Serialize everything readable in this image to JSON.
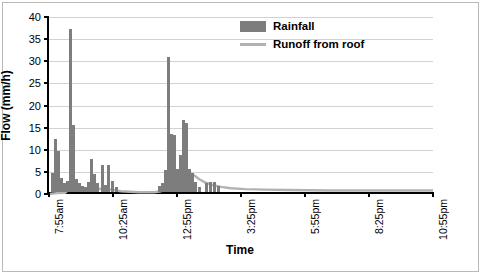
{
  "chart_data": {
    "type": "bar",
    "title": "",
    "xlabel": "Time",
    "ylabel": "Flow (mm/h)",
    "ylim": [
      0,
      40
    ],
    "yticks": [
      0,
      5,
      10,
      15,
      20,
      25,
      30,
      35,
      40
    ],
    "ytick_labels": [
      "0",
      "5",
      "10",
      "15",
      "20",
      "25",
      "30",
      "35",
      "40"
    ],
    "grid": true,
    "legend_position": "top-center",
    "legend": [
      "Rainfall",
      "Runoff from roof"
    ],
    "colors": {
      "rainfall": "#7d7d7d",
      "runoff": "#b2b2b2",
      "axis": "#000000",
      "gridline": "#d2d2d2",
      "frame": "#b9b9b9"
    },
    "xtick_labels": [
      "7:55am",
      "10:25am",
      "12:55pm",
      "3:25pm",
      "5:55pm",
      "8:25pm",
      "10:55pm"
    ],
    "xtick_positions": [
      0,
      64,
      128,
      192,
      256,
      320,
      384
    ],
    "x_axis_range_minutes": [
      475,
      1375
    ],
    "series": [
      {
        "name": "Rainfall",
        "type": "bar",
        "values": [
          {
            "x": 2,
            "y": 4.2
          },
          {
            "x": 5,
            "y": 11.9
          },
          {
            "x": 8,
            "y": 9.3
          },
          {
            "x": 11,
            "y": 3.1
          },
          {
            "x": 14,
            "y": 2.0
          },
          {
            "x": 17,
            "y": 2.6
          },
          {
            "x": 20,
            "y": 36.9
          },
          {
            "x": 23,
            "y": 15.1
          },
          {
            "x": 26,
            "y": 3.0
          },
          {
            "x": 29,
            "y": 2.0
          },
          {
            "x": 32,
            "y": 1.4
          },
          {
            "x": 35,
            "y": 1.2
          },
          {
            "x": 38,
            "y": 2.2
          },
          {
            "x": 41,
            "y": 7.4
          },
          {
            "x": 44,
            "y": 4.0
          },
          {
            "x": 47,
            "y": 2.1
          },
          {
            "x": 52,
            "y": 6.2
          },
          {
            "x": 55,
            "y": 1.6
          },
          {
            "x": 58,
            "y": 6.0
          },
          {
            "x": 62,
            "y": 2.4
          },
          {
            "x": 66,
            "y": 1.2
          },
          {
            "x": 109,
            "y": 1.3
          },
          {
            "x": 112,
            "y": 2.1
          },
          {
            "x": 115,
            "y": 5.0
          },
          {
            "x": 118,
            "y": 30.5
          },
          {
            "x": 121,
            "y": 13.0
          },
          {
            "x": 124,
            "y": 12.8
          },
          {
            "x": 127,
            "y": 5.1
          },
          {
            "x": 130,
            "y": 8.4
          },
          {
            "x": 133,
            "y": 16.2
          },
          {
            "x": 136,
            "y": 15.7
          },
          {
            "x": 139,
            "y": 5.2
          },
          {
            "x": 142,
            "y": 4.3
          },
          {
            "x": 145,
            "y": 2.3
          },
          {
            "x": 149,
            "y": 1.2
          },
          {
            "x": 156,
            "y": 2.1
          },
          {
            "x": 160,
            "y": 2.3
          },
          {
            "x": 164,
            "y": 2.2
          },
          {
            "x": 168,
            "y": 1.3
          }
        ]
      },
      {
        "name": "Runoff from roof",
        "type": "line",
        "points": [
          {
            "x": 0,
            "y": 0.0
          },
          {
            "x": 8,
            "y": 0.2
          },
          {
            "x": 16,
            "y": 0.3
          },
          {
            "x": 20,
            "y": 1.0
          },
          {
            "x": 24,
            "y": 1.6
          },
          {
            "x": 30,
            "y": 1.2
          },
          {
            "x": 40,
            "y": 1.0
          },
          {
            "x": 52,
            "y": 1.2
          },
          {
            "x": 62,
            "y": 1.0
          },
          {
            "x": 72,
            "y": 0.6
          },
          {
            "x": 90,
            "y": 0.4
          },
          {
            "x": 105,
            "y": 0.4
          },
          {
            "x": 112,
            "y": 0.6
          },
          {
            "x": 118,
            "y": 1.5
          },
          {
            "x": 124,
            "y": 2.5
          },
          {
            "x": 130,
            "y": 3.6
          },
          {
            "x": 136,
            "y": 5.0
          },
          {
            "x": 140,
            "y": 5.1
          },
          {
            "x": 144,
            "y": 4.4
          },
          {
            "x": 150,
            "y": 3.4
          },
          {
            "x": 156,
            "y": 2.6
          },
          {
            "x": 164,
            "y": 2.0
          },
          {
            "x": 172,
            "y": 1.6
          },
          {
            "x": 182,
            "y": 1.3
          },
          {
            "x": 196,
            "y": 1.1
          },
          {
            "x": 215,
            "y": 1.0
          },
          {
            "x": 240,
            "y": 0.9
          },
          {
            "x": 280,
            "y": 0.8
          },
          {
            "x": 330,
            "y": 0.8
          },
          {
            "x": 384,
            "y": 0.8
          }
        ]
      }
    ]
  }
}
